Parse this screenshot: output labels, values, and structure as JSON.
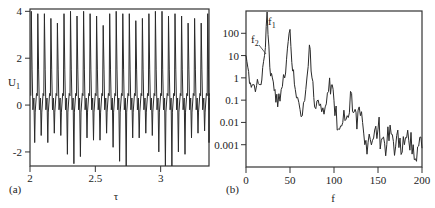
{
  "chart_data": [
    {
      "panel_label": "(a)",
      "type": "line",
      "title": "",
      "xlabel": "τ",
      "ylabel": "U1",
      "xlim": [
        2,
        3.37
      ],
      "ylim": [
        -2.6,
        4.1
      ],
      "xticks": [
        2,
        2.5,
        3
      ],
      "xtick_labels": [
        "2",
        "2.5",
        "3"
      ],
      "yticks": [
        -2,
        0,
        2,
        4
      ],
      "ytick_labels": [
        "-2",
        "0",
        "2",
        "4"
      ],
      "grid": false,
      "description": "Quasi-periodic oscillation: ~28 sharp spikes reaching ~3.5–4 with minima between -0.5 and -2.5",
      "peaks_tau": [
        2.01,
        2.06,
        2.11,
        2.16,
        2.21,
        2.26,
        2.31,
        2.36,
        2.41,
        2.46,
        2.51,
        2.56,
        2.61,
        2.66,
        2.71,
        2.76,
        2.81,
        2.86,
        2.91,
        2.96,
        3.01,
        3.06,
        3.11,
        3.16,
        3.21,
        3.26,
        3.31,
        3.36
      ],
      "peak_values": [
        4.0,
        3.9,
        3.9,
        3.7,
        3.5,
        3.9,
        4.0,
        3.8,
        4.0,
        3.9,
        3.8,
        3.4,
        3.9,
        4.0,
        3.9,
        3.9,
        3.6,
        3.7,
        3.9,
        4.0,
        4.0,
        3.8,
        3.9,
        3.8,
        3.5,
        3.7,
        3.5,
        3.9
      ],
      "trough_values": [
        -1.6,
        -1.3,
        -1.6,
        -1.2,
        -1.3,
        -2.1,
        -2.5,
        -2.2,
        -1.4,
        -1.5,
        -1.5,
        -1.2,
        -1.8,
        -2.4,
        -2.6,
        -1.4,
        -1.4,
        -1.2,
        -1.3,
        -2.0,
        -2.6,
        -2.6,
        -2.0,
        -2.1,
        -1.4,
        -1.2,
        -1.1,
        -1.6
      ]
    },
    {
      "panel_label": "(b)",
      "type": "line",
      "title": "",
      "xlabel": "f",
      "ylabel": "",
      "yscale": "log",
      "xlim": [
        0,
        200
      ],
      "ylim": [
        0.0001,
        1000
      ],
      "xticks": [
        0,
        50,
        100,
        150,
        200
      ],
      "xtick_labels": [
        "0",
        "50",
        "100",
        "150",
        "200"
      ],
      "yticks": [
        0.001,
        0.01,
        0.1,
        1,
        10,
        100
      ],
      "ytick_labels": [
        "0.001",
        "0.01",
        "0.1",
        "1",
        "10",
        "100"
      ],
      "grid": false,
      "annotations": [
        {
          "text": "f1",
          "x": 24,
          "y": 900
        },
        {
          "text": "f2",
          "x": 21,
          "y": 10
        }
      ],
      "x": [
        0,
        2,
        5,
        8,
        12,
        15,
        18,
        21,
        24,
        27,
        30,
        33,
        36,
        40,
        44,
        47,
        50,
        53,
        56,
        60,
        64,
        68,
        72,
        75,
        78,
        82,
        86,
        90,
        95,
        98,
        101,
        105,
        110,
        115,
        120,
        123,
        126,
        130,
        135,
        140,
        145,
        150,
        155,
        160,
        165,
        170,
        175,
        180,
        185,
        190,
        195,
        200
      ],
      "values": [
        10,
        3,
        0.6,
        0.5,
        0.45,
        0.5,
        0.8,
        10,
        900,
        3,
        1,
        0.3,
        0.05,
        0.3,
        1,
        20,
        150,
        2,
        0.3,
        0.08,
        0.02,
        0.3,
        30,
        1,
        0.05,
        0.1,
        0.03,
        0.05,
        1,
        0.5,
        0.02,
        0.005,
        0.01,
        0.02,
        0.2,
        0.03,
        0.005,
        0.02,
        0.001,
        0.003,
        0.002,
        0.005,
        0.002,
        0.001,
        0.003,
        0.0008,
        0.002,
        0.001,
        0.0015,
        0.001,
        0.0008,
        0.0007
      ]
    }
  ]
}
